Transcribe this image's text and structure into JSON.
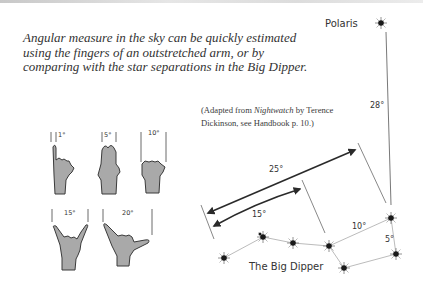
{
  "intro_text": "Angular measure in the sky can be quickly estimated using the fingers of an outstretched arm, or by comparing with the star separations in the Big Dipper.",
  "credit": {
    "prefix": "(Adapted from ",
    "book": "Nightwatch",
    "suffix": " by Terence Dickinson, see Handbook p. 10.)"
  },
  "hands": [
    {
      "gesture": "pinky-finger",
      "angle_label": "1°"
    },
    {
      "gesture": "three-fingers",
      "angle_label": "5°"
    },
    {
      "gesture": "fist",
      "angle_label": "10°"
    },
    {
      "gesture": "index-and-pinky-spread",
      "angle_label": "15°"
    },
    {
      "gesture": "thumb-and-pinky-spread",
      "angle_label": "20°"
    }
  ],
  "sky": {
    "polaris_label": "Polaris",
    "constellation_label": "The Big Dipper",
    "separations": {
      "dubhe_to_polaris": "28°",
      "long_arrow": "25°",
      "short_arrow": "15°",
      "bowl_top": "10°",
      "pointers": "5°"
    }
  },
  "colors": {
    "hand_fill": "#a9a9a9",
    "hand_stroke": "#3a3a3a",
    "star": "#1a1a1a",
    "line": "#888888",
    "arrow": "#2a2a2a"
  }
}
